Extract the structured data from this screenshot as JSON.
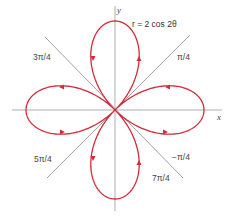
{
  "figure": {
    "equation_label": "r = 2 cos 2θ",
    "axis_labels": {
      "x": "x",
      "y": "y"
    },
    "angle_labels": {
      "pi_over_4": "π/4",
      "three_pi_over_4": "3π/4",
      "five_pi_over_4": "5π/4",
      "seven_pi_over_4": "7π/4",
      "neg_pi_over_4": "−π/4"
    },
    "colors": {
      "curve": "#d42a3a",
      "axes": "#9a9a9a",
      "diagonals": "#8a8a8a",
      "text": "#444444"
    },
    "curve": {
      "type": "polar rose",
      "equation": "r = 2 cos 2θ",
      "petals": 4,
      "max_r": 2,
      "petal_directions": [
        "+x",
        "+y",
        "-x",
        "-y"
      ]
    },
    "reference_lines_angles": [
      "π/4",
      "3π/4",
      "5π/4",
      "7π/4"
    ]
  }
}
